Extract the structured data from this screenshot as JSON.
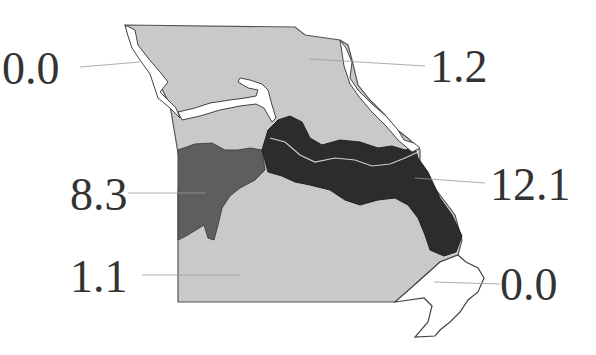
{
  "map": {
    "subject": "Missouri state map divided into regions",
    "colors": {
      "light": "#c8c8c8",
      "medium": "#5c5c5c",
      "dark": "#2c2c2c",
      "none": "#ffffff",
      "outline": "#444444",
      "leader": "#888888"
    },
    "regions": [
      {
        "id": "northwest",
        "label": "0.0",
        "shade": "none"
      },
      {
        "id": "north",
        "label": "1.2",
        "shade": "light"
      },
      {
        "id": "west",
        "label": "8.3",
        "shade": "medium"
      },
      {
        "id": "missouri-river-corridor",
        "label": "12.1",
        "shade": "dark"
      },
      {
        "id": "south",
        "label": "1.1",
        "shade": "light"
      },
      {
        "id": "bootheel",
        "label": "0.0",
        "shade": "none"
      }
    ]
  }
}
